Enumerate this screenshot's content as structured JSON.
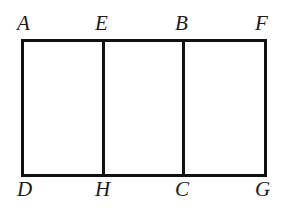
{
  "figure": {
    "background_color": "#ffffff",
    "stroke_color": "#111111",
    "label_color": "#1a1a1a",
    "stroke_width": 3,
    "rectangle": {
      "left": 22,
      "top": 40,
      "right": 265,
      "bottom": 175,
      "width": 243,
      "height": 135
    },
    "dividers": [
      {
        "name": "divider-EH",
        "x": 103,
        "top": 40,
        "bottom": 175
      },
      {
        "name": "divider-BC",
        "x": 183,
        "top": 40,
        "bottom": 175
      }
    ],
    "labels": {
      "top": [
        {
          "id": "A",
          "text": "A",
          "x": 22,
          "y": 40
        },
        {
          "id": "E",
          "text": "E",
          "x": 103,
          "y": 40
        },
        {
          "id": "B",
          "text": "B",
          "x": 183,
          "y": 40
        },
        {
          "id": "F",
          "text": "F",
          "x": 265,
          "y": 40
        }
      ],
      "bottom": [
        {
          "id": "D",
          "text": "D",
          "x": 22,
          "y": 175
        },
        {
          "id": "H",
          "text": "H",
          "x": 103,
          "y": 175
        },
        {
          "id": "C",
          "text": "C",
          "x": 183,
          "y": 175
        },
        {
          "id": "G",
          "text": "G",
          "x": 265,
          "y": 175
        }
      ]
    }
  }
}
